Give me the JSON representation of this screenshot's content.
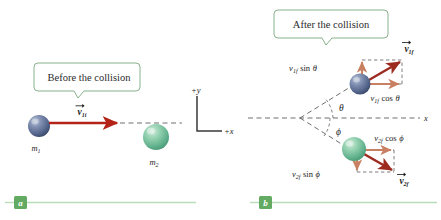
{
  "figure": {
    "panels": [
      {
        "id": "a",
        "badge": "a",
        "callout": "Before the collision",
        "objects": [
          {
            "name": "mass-1",
            "label": "m",
            "subscript": "1",
            "color": "#5a6e96"
          },
          {
            "name": "mass-2",
            "label": "m",
            "subscript": "2",
            "color": "#6fb894"
          }
        ],
        "vectors": [
          {
            "name": "v1i",
            "symbol": "v",
            "subscript": "1i",
            "arrow": true,
            "color": "#b42318"
          }
        ]
      },
      {
        "id": "b",
        "badge": "b",
        "callout": "After the collision",
        "objects": [
          {
            "name": "mass-1",
            "color": "#5a6e96"
          },
          {
            "name": "mass-2",
            "color": "#6fb894"
          }
        ],
        "vectors": [
          {
            "name": "v1f",
            "symbol": "v",
            "subscript": "1f",
            "arrow": true,
            "color": "#9e2b20"
          },
          {
            "name": "v2f",
            "symbol": "v",
            "subscript": "2f",
            "arrow": true,
            "color": "#9e2b20"
          }
        ],
        "components": [
          {
            "name": "v1f-sin-theta",
            "text_symbol": "v",
            "text_sub": "1f",
            "text_fn": "sin",
            "text_angle": "θ"
          },
          {
            "name": "v1f-cos-theta",
            "text_symbol": "v",
            "text_sub": "1f",
            "text_fn": "cos",
            "text_angle": "θ"
          },
          {
            "name": "v2f-cos-phi",
            "text_symbol": "v",
            "text_sub": "2f",
            "text_fn": "cos",
            "text_angle": "ϕ"
          },
          {
            "name": "v2f-sin-phi",
            "text_symbol": "v",
            "text_sub": "2f",
            "text_fn": "sin",
            "text_angle": "ϕ"
          }
        ],
        "angles": [
          {
            "name": "theta",
            "symbol": "θ"
          },
          {
            "name": "phi",
            "symbol": "ϕ"
          }
        ],
        "axis_end_label": "x"
      }
    ],
    "axes": {
      "y_label": "+y",
      "x_label": "+x"
    },
    "colors": {
      "callout_border": "#7aa87f",
      "callout_fill": "#ffffff",
      "badge": "#63ab63",
      "rule": "#b9dcb9",
      "resultant_arrow": "#9e2b20",
      "component_arrow": "#c98062",
      "dashed": "#5d5d5d",
      "sphere_blue": "#5a6e96",
      "sphere_green": "#6fb894"
    }
  }
}
